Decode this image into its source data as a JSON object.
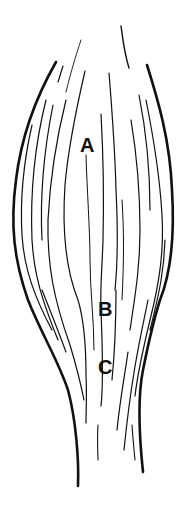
{
  "diagram": {
    "stroke_color": "#111111",
    "background": "#ffffff",
    "labels": [
      {
        "id": "A",
        "text": "A",
        "x": 80,
        "y": 135
      },
      {
        "id": "B",
        "text": "B",
        "x": 98,
        "y": 299
      },
      {
        "id": "C",
        "text": "C",
        "x": 98,
        "y": 357
      }
    ]
  }
}
